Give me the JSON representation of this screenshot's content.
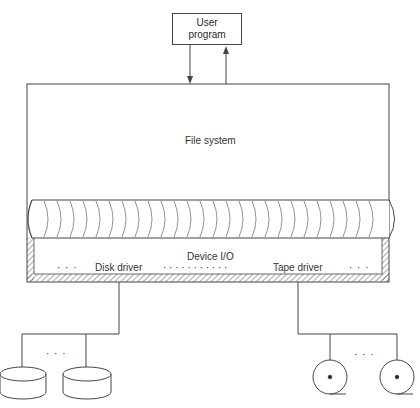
{
  "diagram": {
    "user_program": {
      "label_line1": "User",
      "label_line2": "program"
    },
    "file_system": {
      "label": "File system"
    },
    "device_io": {
      "label": "Device I/O",
      "left_ellipsis": "· · ·",
      "disk_driver": "Disk driver",
      "middle_ellipsis": "· · · · · · · · · · ·",
      "tape_driver": "Tape driver",
      "right_ellipsis": "· · ·"
    },
    "disks": {
      "count_shown": 2,
      "ellipsis": "· · ·"
    },
    "tapes": {
      "count_shown": 2,
      "ellipsis": "· · ·"
    },
    "colors": {
      "line": "#444444",
      "background": "#ffffff"
    }
  }
}
